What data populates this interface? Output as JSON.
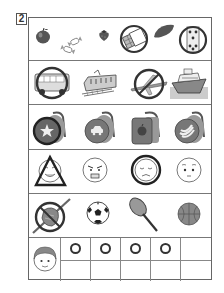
{
  "question": {
    "number": "2"
  },
  "rows": [
    {
      "category": "foods",
      "items": [
        {
          "name": "apple",
          "mark": "none"
        },
        {
          "name": "candies",
          "mark": "none"
        },
        {
          "name": "strawberry",
          "mark": "none"
        },
        {
          "name": "chocolate-bar",
          "mark": "circle"
        },
        {
          "name": "sweet-potato",
          "mark": "none"
        },
        {
          "name": "dice-snack",
          "mark": "circle"
        }
      ]
    },
    {
      "category": "vehicles",
      "items": [
        {
          "name": "bus",
          "mark": "circle"
        },
        {
          "name": "train",
          "mark": "none"
        },
        {
          "name": "airplane",
          "mark": "circle-slash"
        },
        {
          "name": "ship",
          "mark": "none"
        }
      ]
    },
    {
      "category": "backpacks",
      "items": [
        {
          "name": "star-backpack",
          "mark": "circle"
        },
        {
          "name": "car-backpack",
          "mark": "none"
        },
        {
          "name": "apple-backpack",
          "mark": "none"
        },
        {
          "name": "banana-backpack",
          "mark": "none"
        }
      ]
    },
    {
      "category": "faces",
      "items": [
        {
          "name": "happy-face",
          "mark": "triangle"
        },
        {
          "name": "angry-face",
          "mark": "none"
        },
        {
          "name": "sad-face",
          "mark": "circle"
        },
        {
          "name": "neutral-face",
          "mark": "none"
        }
      ]
    },
    {
      "category": "sports",
      "items": [
        {
          "name": "baseball-glove-bat",
          "mark": "circle-slash"
        },
        {
          "name": "soccer-ball",
          "mark": "none"
        },
        {
          "name": "tennis-racket",
          "mark": "none"
        },
        {
          "name": "basketball",
          "mark": "none"
        }
      ]
    }
  ],
  "answer_grid": {
    "avatar": "boy-face",
    "top_row": [
      "O",
      "O",
      "O",
      "O",
      ""
    ],
    "bottom_row": [
      "",
      "",
      "",
      "",
      ""
    ]
  }
}
